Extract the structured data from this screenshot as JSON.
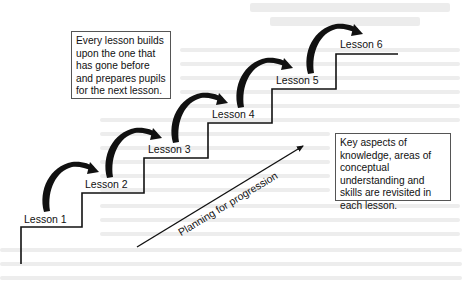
{
  "diagram": {
    "type": "staircase-progression",
    "colors": {
      "line": "#111111",
      "box_border": "#555555",
      "background": "#ffffff",
      "ghost_text": "#ececec"
    },
    "lessons": [
      {
        "label": "Lesson 1"
      },
      {
        "label": "Lesson 2"
      },
      {
        "label": "Lesson 3"
      },
      {
        "label": "Lesson 4"
      },
      {
        "label": "Lesson 5"
      },
      {
        "label": "Lesson 6"
      }
    ],
    "boxes": {
      "top_left": "Every lesson builds upon the one that has gone before and prepares pupils for the next lesson.",
      "bottom_right": "Key aspects of knowledge, areas of conceptual understanding and skills are revisited in each lesson."
    },
    "progression_arrow": {
      "label": "Planning for progression"
    }
  }
}
